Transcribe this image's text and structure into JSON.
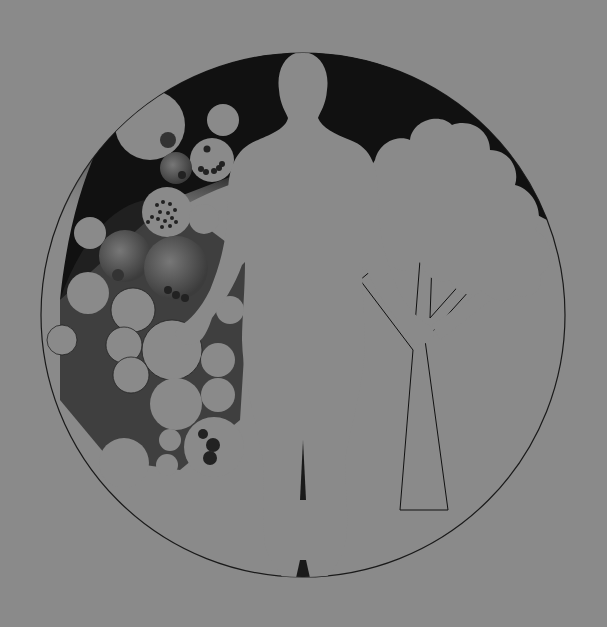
{
  "illustration": {
    "subject": "human figure standing between a cluster of cells and a tree, inside a circle",
    "colors": {
      "background": "#8a8a8a",
      "shape_fill": "#8a8a8a",
      "ink": "#111111",
      "stipple": "#2a2a2a"
    },
    "circle": {
      "cx": 303,
      "cy": 315,
      "r": 262
    },
    "elements": [
      "cell-cluster",
      "human-silhouette",
      "tree"
    ]
  }
}
